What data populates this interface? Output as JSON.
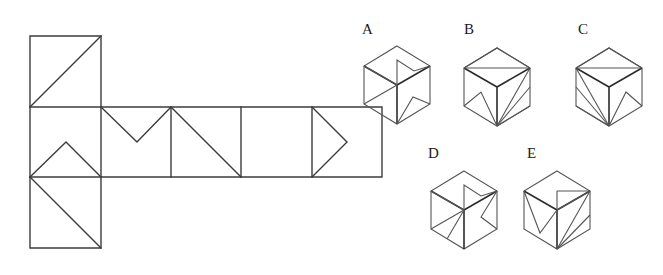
{
  "figure": {
    "type": "geometry-puzzle",
    "stroke_color": "#3c3c3c",
    "background_color": "#ffffff",
    "net": {
      "name": "cube-net",
      "cell_size": 70.5,
      "origin": {
        "x": 30,
        "y": 36
      },
      "layout": "T-shaped net: one square above the left end of a horizontal strip of five squares, and one square below that same left end",
      "squares": [
        {
          "id": "top",
          "col": 0,
          "row": 0
        },
        {
          "id": "mid-1",
          "col": 0,
          "row": 1
        },
        {
          "id": "mid-2",
          "col": 1,
          "row": 1
        },
        {
          "id": "mid-3",
          "col": 2,
          "row": 1
        },
        {
          "id": "mid-4",
          "col": 3,
          "row": 1
        },
        {
          "id": "mid-5",
          "col": 4,
          "row": 1
        },
        {
          "id": "bottom",
          "col": 0,
          "row": 2
        }
      ],
      "markings": [
        {
          "square": "top",
          "shape": "diagonal from bottom-left to top-right"
        },
        {
          "square": "mid-1",
          "shape": "peak: bottom-left to top-center to bottom-right"
        },
        {
          "square": "mid-2",
          "shape": "vee: top-left to bottom-center to top-right"
        },
        {
          "square": "mid-3",
          "shape": "diagonal from top-left to bottom-right"
        },
        {
          "square": "mid-4",
          "shape": "triangle pointing right: top-left to mid-right to bottom-left"
        },
        {
          "square": "mid-5",
          "shape": "blank"
        },
        {
          "square": "bottom",
          "shape": "diagonal from top-left to bottom-right"
        }
      ]
    },
    "options": [
      {
        "id": "A",
        "label": "A",
        "name": "cube-option-a",
        "center": {
          "x": 397,
          "y": 82
        },
        "faces": {
          "top": "notch / folded flap shape",
          "left": "diagonal from top-back to bottom-front",
          "right": "small triangle near bottom"
        }
      },
      {
        "id": "B",
        "label": "B",
        "name": "cube-option-b",
        "center": {
          "x": 496,
          "y": 84
        },
        "faces": {
          "top": "triangle from back corner",
          "left": "small triangle near bottom-left",
          "right": "two lines converging at bottom corner"
        }
      },
      {
        "id": "C",
        "label": "C",
        "name": "cube-option-c",
        "center": {
          "x": 608,
          "y": 84
        },
        "faces": {
          "top": "triangle from back corner",
          "left": "two lines converging at bottom corner",
          "right": "small triangle near bottom-right"
        }
      },
      {
        "id": "D",
        "label": "D",
        "name": "cube-option-d",
        "center": {
          "x": 464,
          "y": 208
        },
        "faces": {
          "top": "notch / folded flap shape",
          "left": "two diagonals from centre",
          "right": "vee pointing left"
        }
      },
      {
        "id": "E",
        "label": "E",
        "name": "cube-option-e",
        "center": {
          "x": 557,
          "y": 208
        },
        "faces": {
          "top": "square notch at front-right",
          "left": "vee pointing down",
          "right": "two lines converging at bottom corner"
        }
      }
    ]
  },
  "labels": {
    "a": "A",
    "b": "B",
    "c": "C",
    "d": "D",
    "e": "E"
  }
}
